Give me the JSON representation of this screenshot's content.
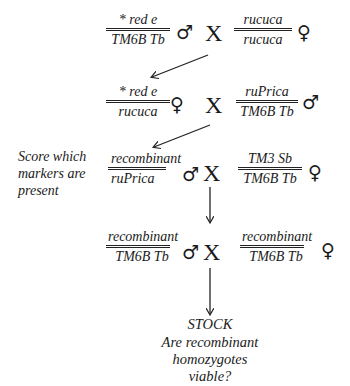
{
  "generation1": {
    "left": {
      "top": "* red e",
      "bottom": "TM6B Tb",
      "sex": "♂"
    },
    "cross": "X",
    "right": {
      "top": "rucuca",
      "bottom": "rucuca",
      "sex": "♀"
    }
  },
  "generation2": {
    "left": {
      "top": "* red e",
      "bottom": "rucuca",
      "sex": "♀"
    },
    "cross": "X",
    "right": {
      "top": "ruPrica",
      "bottom": "TM6B Tb",
      "sex": "♂"
    }
  },
  "generation3": {
    "note": [
      "Score which",
      "markers are",
      "present"
    ],
    "left": {
      "top": "recombinant",
      "bottom": "ruPrica",
      "sex": "♂"
    },
    "cross": "X",
    "right": {
      "top": "TM3 Sb",
      "bottom": "TM6B Tb",
      "sex": "♀"
    }
  },
  "generation4": {
    "left": {
      "top": "recombinant",
      "bottom": "TM6B Tb",
      "sex": "♂"
    },
    "cross": "X",
    "right": {
      "top": "recombinant",
      "bottom": "TM6B Tb",
      "sex": "♀"
    }
  },
  "outcome": {
    "title": "STOCK",
    "question": [
      "Are recombinant",
      "homozygotes",
      "viable?"
    ]
  },
  "colors": {
    "ink": "#1a1a1a",
    "background": "#ffffff"
  }
}
